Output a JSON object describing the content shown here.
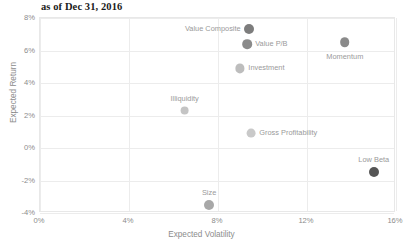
{
  "chart_data": {
    "type": "scatter",
    "title": "as of Dec 31, 2016",
    "xlabel": "Expected Volatility",
    "ylabel": "Expected Return",
    "xlim": [
      0,
      16
    ],
    "ylim": [
      -4,
      8
    ],
    "xticks": [
      "0%",
      "4%",
      "8%",
      "12%",
      "16%"
    ],
    "xtick_values": [
      0,
      4,
      8,
      12,
      16
    ],
    "yticks": [
      "8%",
      "6%",
      "4%",
      "2%",
      "0%",
      "-2%",
      "-4%"
    ],
    "ytick_values": [
      8,
      6,
      4,
      2,
      0,
      -2,
      -4
    ],
    "grid": true,
    "legend": "none",
    "marker_color": "#9e9e9e",
    "label_color": "#9a9a9a",
    "points": [
      {
        "name": "Value Composite",
        "x": 9.4,
        "y": 7.3,
        "label": "Value Composite",
        "label_pos": "left",
        "color": "#7d7d7d",
        "radius": 5.0
      },
      {
        "name": "Value P/B",
        "x": 9.3,
        "y": 6.4,
        "label": "Value P/B",
        "label_pos": "right",
        "color": "#8a8a8a",
        "radius": 4.8
      },
      {
        "name": "Momentum",
        "x": 13.7,
        "y": 6.5,
        "label": "Momentum",
        "label_pos": "below",
        "color": "#8a8a8a",
        "radius": 4.8
      },
      {
        "name": "Investment",
        "x": 9.0,
        "y": 4.9,
        "label": "Investment",
        "label_pos": "right",
        "color": "#bdbdbd",
        "radius": 4.6
      },
      {
        "name": "Illiquidity",
        "x": 6.5,
        "y": 2.3,
        "label": "Illiquidity",
        "label_pos": "above",
        "color": "#c4c4c4",
        "radius": 4.4
      },
      {
        "name": "Gross Profitability",
        "x": 9.5,
        "y": 0.9,
        "label": "Gross Profitability",
        "label_pos": "right",
        "color": "#c9c9c9",
        "radius": 4.4
      },
      {
        "name": "Low Beta",
        "x": 15.0,
        "y": -1.5,
        "label": "Low Beta",
        "label_pos": "above",
        "color": "#555555",
        "radius": 5.0
      },
      {
        "name": "Size",
        "x": 7.6,
        "y": -3.5,
        "label": "Size",
        "label_pos": "above",
        "color": "#a8a8a8",
        "radius": 5.0
      }
    ]
  }
}
